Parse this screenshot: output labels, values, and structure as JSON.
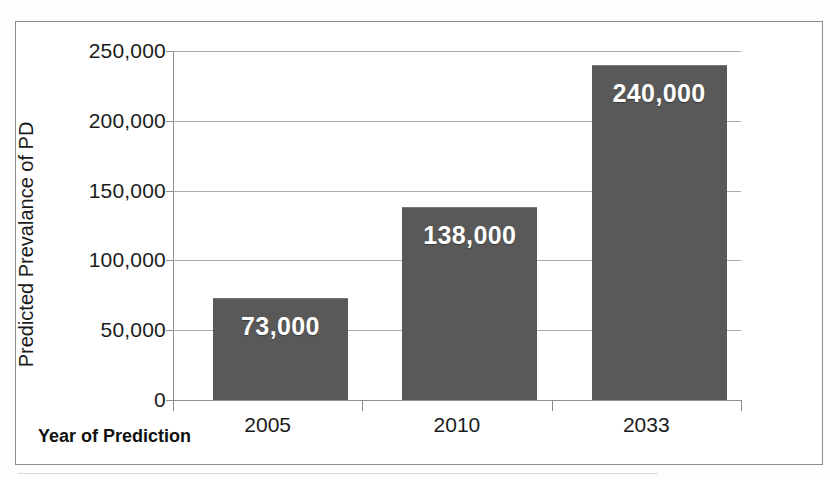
{
  "chart_data": {
    "type": "bar",
    "title": "",
    "xlabel": "Year of Prediction",
    "ylabel": "Predicted  Prevalance of PD",
    "categories": [
      "2005",
      "2010",
      "2033"
    ],
    "values": [
      73000,
      138000,
      240000
    ],
    "data_labels": [
      "73,000",
      "138,000",
      "240,000"
    ],
    "ylim": [
      0,
      250000
    ],
    "ytick_values": [
      0,
      50000,
      100000,
      150000,
      200000,
      250000
    ],
    "ytick_labels": [
      "0",
      "50,000",
      "100,000",
      "150,000",
      "200,000",
      "250,000"
    ],
    "grid": true,
    "legend": false,
    "bar_color": "#595959",
    "label_color": "#ffffff",
    "axis_color": "#8d8d8d",
    "gridline_color": "#aaaaaa",
    "series": [
      {
        "name": "Predicted Prevalance of PD",
        "values": [
          73000,
          138000,
          240000
        ]
      }
    ]
  }
}
